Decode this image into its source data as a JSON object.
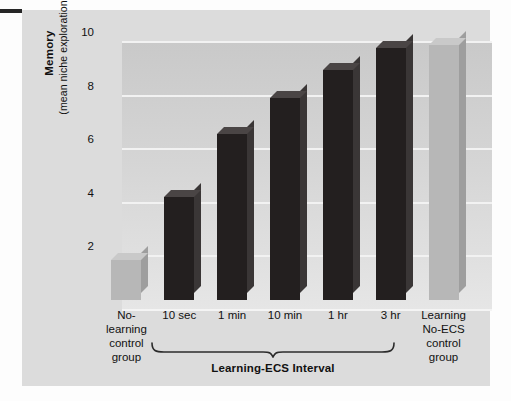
{
  "figure": {
    "panel_bg": "#dcdcdc",
    "page_bg": "#fdfdfd",
    "edge_dash_color": "#262626"
  },
  "chart_data": {
    "type": "bar",
    "title": "",
    "xlabel": "Learning-ECS Interval",
    "ylabel": "Memory (mean niche explorations)",
    "ylabel_line1": "Memory",
    "ylabel_line2": "(mean niche explorations)",
    "ylim": [
      0,
      10
    ],
    "yticks": [
      2,
      4,
      6,
      8,
      10
    ],
    "ytick_labels": [
      "2",
      "4",
      "6",
      "8",
      "10"
    ],
    "grid": true,
    "grid_axis": "y",
    "grid_color": "#f2f2f2",
    "legend": "none",
    "categories": [
      "No-learning control group",
      "10 sec",
      "1 min",
      "10 min",
      "1 hr",
      "3 hr",
      "Learning No-ECS control group"
    ],
    "values": [
      1.5,
      3.85,
      6.2,
      7.55,
      8.6,
      9.4,
      9.5
    ],
    "bar_styles": [
      "light",
      "dark",
      "dark",
      "dark",
      "dark",
      "dark",
      "light"
    ],
    "colors": {
      "dark_bar": "#231f1f",
      "light_bar": "#b7b7b7",
      "plot_bg_top": "#c9c9c9",
      "plot_bg_bottom": "#e6e6e6"
    },
    "annotations": [
      {
        "name": "group-brace",
        "covers": [
          "10 sec",
          "1 min",
          "10 min",
          "1 hr",
          "3 hr"
        ],
        "label": "Learning-ECS Interval"
      }
    ]
  },
  "axis": {
    "ticks": [
      {
        "value": 10,
        "label": "10"
      },
      {
        "value": 8,
        "label": "8"
      },
      {
        "value": 6,
        "label": "6"
      },
      {
        "value": 4,
        "label": "4"
      },
      {
        "value": 2,
        "label": "2"
      }
    ]
  },
  "xaxis": {
    "labels": [
      {
        "name": "no-learning-control-group",
        "lines": [
          "No-",
          "learning",
          "control",
          "group"
        ],
        "multiline": true
      },
      {
        "name": "10-sec",
        "lines": [
          "10 sec"
        ],
        "multiline": false
      },
      {
        "name": "1-min",
        "lines": [
          "1 min"
        ],
        "multiline": false
      },
      {
        "name": "10-min",
        "lines": [
          "10 min"
        ],
        "multiline": false
      },
      {
        "name": "1-hr",
        "lines": [
          "1 hr"
        ],
        "multiline": false
      },
      {
        "name": "3-hr",
        "lines": [
          "3 hr"
        ],
        "multiline": false
      },
      {
        "name": "learning-no-ecs-control-group",
        "lines": [
          "Learning",
          "No-ECS",
          "control",
          "group"
        ],
        "multiline": true
      }
    ],
    "group_label": "Learning-ECS Interval"
  }
}
